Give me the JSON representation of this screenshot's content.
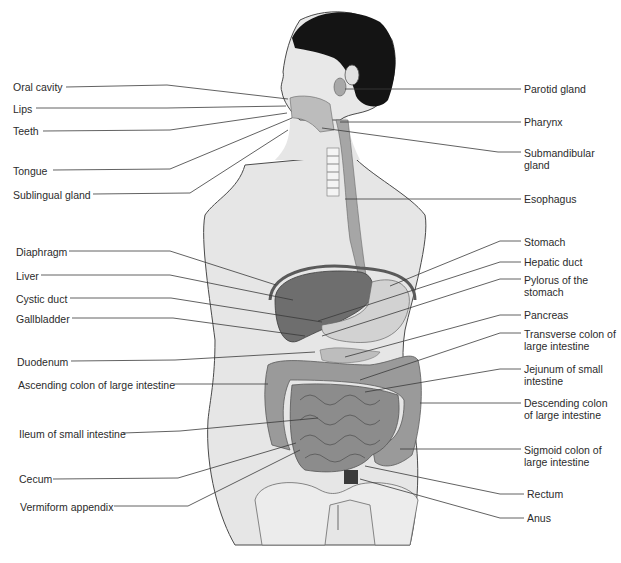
{
  "figure": {
    "colors": {
      "background": "#ffffff",
      "body": "#e6e6e6",
      "outline": "#4a4a4a",
      "hair": "#141414",
      "organ_dark": "#6e6e6e",
      "organ_mid": "#8c8c8c",
      "organ_light": "#c4c4c4",
      "leader_line": "#3a3a3a",
      "text": "#2b2b2b"
    }
  },
  "labels_left": [
    {
      "text": "Oral cavity",
      "x": 13,
      "y": 81,
      "lx1": 66,
      "ly1": 87,
      "lx2": 167,
      "ly2": 85,
      "tx": 288,
      "ty": 99
    },
    {
      "text": "Lips",
      "x": 13,
      "y": 103,
      "lx1": 36,
      "ly1": 108,
      "lx2": 167,
      "ly2": 108,
      "tx": 286,
      "ty": 106
    },
    {
      "text": "Teeth",
      "x": 13,
      "y": 125,
      "lx1": 43,
      "ly1": 131,
      "lx2": 170,
      "ly2": 130,
      "tx": 287,
      "ty": 113
    },
    {
      "text": "Tongue",
      "x": 13,
      "y": 165,
      "lx1": 53,
      "ly1": 170,
      "lx2": 170,
      "ly2": 169,
      "tx": 292,
      "ty": 118
    },
    {
      "text": "Sublingual gland",
      "x": 13,
      "y": 189,
      "lx1": 93,
      "ly1": 194,
      "lx2": 190,
      "ly2": 193,
      "tx": 288,
      "ty": 130
    },
    {
      "text": "Diaphragm",
      "x": 16,
      "y": 246,
      "lx1": 69,
      "ly1": 251,
      "lx2": 170,
      "ly2": 251,
      "tx": 276,
      "ty": 285
    },
    {
      "text": "Liver",
      "x": 16,
      "y": 270,
      "lx1": 41,
      "ly1": 275,
      "lx2": 170,
      "ly2": 275,
      "tx": 293,
      "ty": 300
    },
    {
      "text": "Cystic duct",
      "x": 16,
      "y": 293,
      "lx1": 70,
      "ly1": 298,
      "lx2": 171,
      "ly2": 298,
      "tx": 322,
      "ty": 322
    },
    {
      "text": "Gallbladder",
      "x": 16,
      "y": 313,
      "lx1": 72,
      "ly1": 318,
      "lx2": 173,
      "ly2": 318,
      "tx": 305,
      "ty": 336
    },
    {
      "text": "Duodenum",
      "x": 17,
      "y": 356,
      "lx1": 71,
      "ly1": 361,
      "lx2": 175,
      "ly2": 360,
      "tx": 315,
      "ty": 352
    },
    {
      "text": "Ascending colon of large intestine",
      "x": 18,
      "y": 379,
      "lx1": 174,
      "ly1": 384,
      "lx2": 268,
      "ly2": 384,
      "tx": 268,
      "ty": 384
    },
    {
      "text": "Ileum of small intestine",
      "x": 19,
      "y": 428,
      "lx1": 123,
      "ly1": 433,
      "lx2": 180,
      "ly2": 431,
      "tx": 318,
      "ty": 418
    },
    {
      "text": "Cecum",
      "x": 19,
      "y": 473,
      "lx1": 53,
      "ly1": 479,
      "lx2": 178,
      "ly2": 478,
      "tx": 296,
      "ty": 443
    },
    {
      "text": "Vermiform appendix",
      "x": 20,
      "y": 501,
      "lx1": 114,
      "ly1": 506,
      "lx2": 188,
      "ly2": 506,
      "tx": 300,
      "ty": 450
    }
  ],
  "labels_right": [
    {
      "text": "Parotid gland",
      "x": 524,
      "y": 83,
      "lx1": 521,
      "ly1": 89,
      "lx2": 345,
      "ly2": 89,
      "tx": 345,
      "ty": 89
    },
    {
      "text": "Pharynx",
      "x": 524,
      "y": 116,
      "lx1": 521,
      "ly1": 122,
      "lx2": 340,
      "ly2": 122,
      "tx": 340,
      "ty": 122
    },
    {
      "text": "Submandibular gland",
      "x": 524,
      "y": 147,
      "lx1": 521,
      "ly1": 152,
      "lx2": 498,
      "ly2": 152,
      "tx": 322,
      "ty": 128
    },
    {
      "text": "Esophagus",
      "x": 524,
      "y": 193,
      "lx1": 521,
      "ly1": 199,
      "lx2": 345,
      "ly2": 199,
      "tx": 345,
      "ty": 199
    },
    {
      "text": "Stomach",
      "x": 524,
      "y": 236,
      "lx1": 521,
      "ly1": 241,
      "lx2": 500,
      "ly2": 241,
      "tx": 390,
      "ty": 286
    },
    {
      "text": "Hepatic duct",
      "x": 524,
      "y": 256,
      "lx1": 521,
      "ly1": 262,
      "lx2": 500,
      "ly2": 262,
      "tx": 318,
      "ty": 321
    },
    {
      "text": "Pylorus of the stomach",
      "x": 524,
      "y": 274,
      "lx1": 521,
      "ly1": 279,
      "lx2": 500,
      "ly2": 279,
      "tx": 322,
      "ty": 336
    },
    {
      "text": "Pancreas",
      "x": 524,
      "y": 309,
      "lx1": 521,
      "ly1": 315,
      "lx2": 500,
      "ly2": 315,
      "tx": 345,
      "ty": 357
    },
    {
      "text": "Transverse colon of large intestine",
      "x": 524,
      "y": 328,
      "lx1": 521,
      "ly1": 333,
      "lx2": 500,
      "ly2": 333,
      "tx": 360,
      "ty": 380
    },
    {
      "text": "Jejunum of small intestine",
      "x": 524,
      "y": 363,
      "lx1": 521,
      "ly1": 369,
      "lx2": 500,
      "ly2": 369,
      "tx": 365,
      "ty": 392
    },
    {
      "text": "Descending colon of large intestine",
      "x": 524,
      "y": 397,
      "lx1": 521,
      "ly1": 403,
      "lx2": 420,
      "ly2": 403,
      "tx": 420,
      "ty": 403
    },
    {
      "text": "Sigmoid colon of large intestine",
      "x": 524,
      "y": 444,
      "lx1": 521,
      "ly1": 449,
      "lx2": 400,
      "ly2": 449,
      "tx": 400,
      "ty": 449
    },
    {
      "text": "Rectum",
      "x": 527,
      "y": 488,
      "lx1": 524,
      "ly1": 494,
      "lx2": 500,
      "ly2": 494,
      "tx": 365,
      "ty": 466
    },
    {
      "text": "Anus",
      "x": 527,
      "y": 512,
      "lx1": 524,
      "ly1": 518,
      "lx2": 500,
      "ly2": 518,
      "tx": 360,
      "ty": 479
    }
  ]
}
